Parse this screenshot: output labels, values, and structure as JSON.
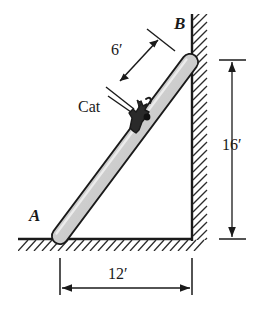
{
  "figure": {
    "type": "statics-diagram",
    "colors": {
      "line": "#1a1a1a",
      "ladder_fill": "#c9c9c9",
      "ladder_highlight": "#e6e6e6",
      "hatch": "#2b2b2b",
      "background": "#ffffff"
    },
    "labels": {
      "point_a": "A",
      "point_b": "B",
      "cat": "Cat",
      "dim_along_ladder": "6′",
      "dim_wall_height": "16′",
      "dim_ground_span": "12′"
    },
    "geometry": {
      "ladder_foot": {
        "x": 60,
        "y": 238
      },
      "ladder_top": {
        "x": 192,
        "y": 60
      },
      "wall_x": 192,
      "ground_y": 238,
      "cat_position": {
        "x": 140,
        "y": 115
      }
    },
    "dimensions": {
      "ladder_segment_from_top_feet": 6,
      "wall_height_feet": 16,
      "ground_span_feet": 12
    }
  }
}
